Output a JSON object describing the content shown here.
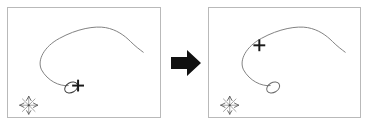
{
  "figure": {
    "caption": "",
    "background_color": "#ffffff",
    "width": 367,
    "height": 127
  },
  "colors": {
    "panel_border": "#b9b9b9",
    "panel_background": "#ffffff",
    "curve_stroke": "#808080",
    "marker_stroke": "#1a1a1a",
    "arrow_fill": "#111111",
    "axis_stroke": "#9a9a9a"
  },
  "arrow": {
    "icon": "right-arrow-icon",
    "label": "",
    "direction": "right",
    "fill": "#111111"
  },
  "panels": [
    {
      "id": "before",
      "title": "",
      "border_color": "#b9b9b9",
      "curve": {
        "name": "trajectory-curve",
        "stroke": "#808080",
        "stroke_width": 1,
        "path": "M 61 79 C 52 80 40 74 34 63 C 29 53 37 39 52 31 C 70 21 88 18 99 20 C 110 22 118 28 124 34 C 129 39 133 42 137 45"
      },
      "ellipse": {
        "name": "loop-marker",
        "cx": 64,
        "cy": 81,
        "rx": 7,
        "ry": 5,
        "rotation": -30,
        "stroke": "#3a3a3a"
      },
      "cross": {
        "name": "cross-marker",
        "cx": 71,
        "cy": 79,
        "size": 6,
        "stroke_width": 2,
        "stroke": "#1a1a1a",
        "position_label": "at-loop"
      },
      "compass": {
        "name": "compass-rose-icon",
        "cx": 21,
        "cy": 99,
        "radius": 9
      }
    },
    {
      "id": "after",
      "title": "",
      "border_color": "#b9b9b9",
      "curve": {
        "name": "trajectory-curve",
        "stroke": "#808080",
        "stroke_width": 1,
        "path": "M 62 79 C 53 80 41 74 35 63 C 30 53 38 39 53 31 C 71 21 89 18 100 20 C 111 22 119 28 125 34 C 130 39 134 42 138 45"
      },
      "ellipse": {
        "name": "loop-marker",
        "cx": 65,
        "cy": 81,
        "rx": 7,
        "ry": 5,
        "rotation": -30,
        "stroke": "#6a6a6a"
      },
      "cross": {
        "name": "cross-marker",
        "cx": 51,
        "cy": 38,
        "size": 6,
        "stroke_width": 2,
        "stroke": "#1a1a1a",
        "position_label": "on-curve"
      },
      "compass": {
        "name": "compass-rose-icon",
        "cx": 21,
        "cy": 99,
        "radius": 9
      }
    }
  ]
}
